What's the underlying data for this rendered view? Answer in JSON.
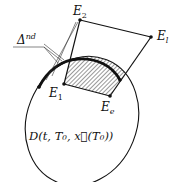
{
  "diagram": {
    "points": {
      "E2": {
        "label": "E",
        "sub": "2"
      },
      "El": {
        "label": "E",
        "sub": "l"
      },
      "E1": {
        "label": "E",
        "sub": "1"
      },
      "Ee": {
        "label": "E",
        "sub": "e"
      }
    },
    "delta_label": {
      "base": "Δ",
      "sup": "nd"
    },
    "region_label": "D(t, T₀, x⃗(T₀))",
    "colors": {
      "stroke": "#111111",
      "hatch": "#444444",
      "background": "#ffffff"
    }
  }
}
